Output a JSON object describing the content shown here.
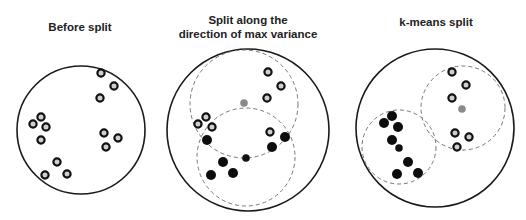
{
  "panels": [
    {
      "title_lines": [
        "Before split"
      ],
      "boundary": {
        "cx": 81,
        "cy": 130,
        "r": 64
      },
      "dashed_clusters": [],
      "points": [
        {
          "x": 101,
          "y": 73,
          "type": "ring"
        },
        {
          "x": 114,
          "y": 86,
          "type": "ring"
        },
        {
          "x": 100,
          "y": 98,
          "type": "ring"
        },
        {
          "x": 41,
          "y": 117,
          "type": "ring"
        },
        {
          "x": 33,
          "y": 124,
          "type": "ring"
        },
        {
          "x": 46,
          "y": 127,
          "type": "ring"
        },
        {
          "x": 41,
          "y": 140,
          "type": "ring"
        },
        {
          "x": 104,
          "y": 133,
          "type": "ring"
        },
        {
          "x": 118,
          "y": 138,
          "type": "ring"
        },
        {
          "x": 106,
          "y": 147,
          "type": "ring"
        },
        {
          "x": 57,
          "y": 162,
          "type": "ring"
        },
        {
          "x": 45,
          "y": 175,
          "type": "ring"
        },
        {
          "x": 67,
          "y": 174,
          "type": "ring"
        }
      ],
      "centroids": []
    },
    {
      "title_lines": [
        "Split along the",
        "direction of max variance"
      ],
      "boundary": {
        "cx": 248,
        "cy": 130,
        "r": 81
      },
      "dashed_clusters": [
        {
          "cx": 244,
          "cy": 104,
          "r": 54
        },
        {
          "cx": 246,
          "cy": 157,
          "r": 49
        }
      ],
      "points": [
        {
          "x": 268,
          "y": 72,
          "type": "ring"
        },
        {
          "x": 281,
          "y": 86,
          "type": "ring"
        },
        {
          "x": 267,
          "y": 98,
          "type": "ring"
        },
        {
          "x": 206,
          "y": 117,
          "type": "ring"
        },
        {
          "x": 198,
          "y": 124,
          "type": "ring"
        },
        {
          "x": 212,
          "y": 127,
          "type": "ring"
        },
        {
          "x": 270,
          "y": 132,
          "type": "ring"
        },
        {
          "x": 285,
          "y": 137,
          "type": "filled"
        },
        {
          "x": 207,
          "y": 140,
          "type": "filled"
        },
        {
          "x": 272,
          "y": 147,
          "type": "filled"
        },
        {
          "x": 223,
          "y": 162,
          "type": "filled"
        },
        {
          "x": 211,
          "y": 175,
          "type": "filled"
        },
        {
          "x": 233,
          "y": 173,
          "type": "filled"
        }
      ],
      "centroids": [
        {
          "x": 244,
          "y": 103,
          "color": "#8a8a8a"
        },
        {
          "x": 246,
          "y": 158,
          "color": "#111111"
        }
      ]
    },
    {
      "title_lines": [
        "k-means split"
      ],
      "boundary": {
        "cx": 435,
        "cy": 128,
        "r": 79
      },
      "dashed_clusters": [
        {
          "cx": 463,
          "cy": 108,
          "r": 42
        },
        {
          "cx": 399,
          "cy": 147,
          "r": 37
        }
      ],
      "points": [
        {
          "x": 452,
          "y": 72,
          "type": "ring"
        },
        {
          "x": 466,
          "y": 85,
          "type": "ring"
        },
        {
          "x": 452,
          "y": 98,
          "type": "ring"
        },
        {
          "x": 455,
          "y": 133,
          "type": "ring"
        },
        {
          "x": 469,
          "y": 137,
          "type": "ring"
        },
        {
          "x": 457,
          "y": 147,
          "type": "ring"
        },
        {
          "x": 392,
          "y": 116,
          "type": "filled"
        },
        {
          "x": 384,
          "y": 123,
          "type": "filled"
        },
        {
          "x": 398,
          "y": 127,
          "type": "filled"
        },
        {
          "x": 392,
          "y": 140,
          "type": "filled"
        },
        {
          "x": 408,
          "y": 162,
          "type": "filled"
        },
        {
          "x": 397,
          "y": 174,
          "type": "filled"
        },
        {
          "x": 418,
          "y": 173,
          "type": "filled"
        }
      ],
      "centroids": [
        {
          "x": 462,
          "y": 109,
          "color": "#8a8a8a"
        },
        {
          "x": 399,
          "y": 148,
          "color": "#111111"
        }
      ]
    }
  ],
  "title_positions": [
    {
      "cx": 80,
      "top": 20
    },
    {
      "cx": 248,
      "top": 13
    },
    {
      "cx": 436,
      "top": 15
    }
  ],
  "colors": {
    "boundary": "#1a1a1a",
    "dashed": "#777777",
    "ring_stroke": "#111111",
    "ring_fill": "#cfcfcf",
    "filled": "#0d0d0d"
  }
}
